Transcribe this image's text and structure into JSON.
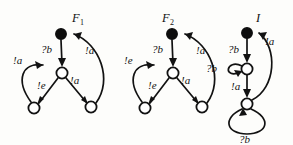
{
  "figure": {
    "name": "three-automata-figure",
    "background_color": "#fdfdfb",
    "ink_color": "#121212",
    "width": 293,
    "height": 145
  },
  "automata": [
    {
      "id": "F1",
      "title": "F",
      "title_subscript": "1",
      "states": [
        {
          "id": "f1-s0",
          "kind": "filled",
          "cx": 61,
          "cy": 34,
          "r": 5.2
        },
        {
          "id": "f1-s1",
          "kind": "open",
          "cx": 62,
          "cy": 73,
          "r": 5.6
        },
        {
          "id": "f1-s2",
          "kind": "open",
          "cx": 34,
          "cy": 108,
          "r": 5.6
        },
        {
          "id": "f1-s3",
          "kind": "open",
          "cx": 91,
          "cy": 107,
          "r": 5.6
        }
      ],
      "transitions": [
        {
          "id": "f1-t1",
          "label": "?b",
          "from": "f1-s0",
          "to": "f1-s1"
        },
        {
          "id": "f1-t2",
          "label": "!a",
          "from": "f1-s3",
          "to": "f1-s0"
        },
        {
          "id": "f1-t3",
          "label": "!e",
          "from": "f1-s1",
          "to": "f1-s2"
        },
        {
          "id": "f1-t4",
          "label": "!a",
          "from": "f1-s1",
          "to": "f1-s3"
        },
        {
          "id": "f1-t5",
          "label": "!a",
          "from": "f1-s2",
          "to": "f1-s1"
        }
      ]
    },
    {
      "id": "F2",
      "title": "F",
      "title_subscript": "2",
      "states": [
        {
          "id": "f2-s0",
          "kind": "filled",
          "cx": 172,
          "cy": 34,
          "r": 5.2
        },
        {
          "id": "f2-s1",
          "kind": "open",
          "cx": 173,
          "cy": 73,
          "r": 5.6
        },
        {
          "id": "f2-s2",
          "kind": "open",
          "cx": 145,
          "cy": 108,
          "r": 5.6
        },
        {
          "id": "f2-s3",
          "kind": "open",
          "cx": 202,
          "cy": 107,
          "r": 5.6
        }
      ],
      "transitions": [
        {
          "id": "f2-t1",
          "label": "?b",
          "from": "f2-s0",
          "to": "f2-s1"
        },
        {
          "id": "f2-t2",
          "label": "!a",
          "from": "f2-s3",
          "to": "f2-s0"
        },
        {
          "id": "f2-t3",
          "label": "!e",
          "from": "f2-s1",
          "to": "f2-s2"
        },
        {
          "id": "f2-t4",
          "label": "!a",
          "from": "f2-s1",
          "to": "f2-s3"
        },
        {
          "id": "f2-t5",
          "label": "!e",
          "from": "f2-s2",
          "to": "f2-s1"
        }
      ]
    },
    {
      "id": "I",
      "title": "I",
      "title_subscript": "",
      "states": [
        {
          "id": "i-s0",
          "kind": "filled",
          "cx": 247,
          "cy": 33,
          "r": 5.2
        },
        {
          "id": "i-s1",
          "kind": "open",
          "cx": 247,
          "cy": 69,
          "r": 5.6
        },
        {
          "id": "i-s2",
          "kind": "open",
          "cx": 247,
          "cy": 104,
          "r": 5.6
        }
      ],
      "transitions": [
        {
          "id": "i-t1",
          "label": "?b",
          "from": "i-s0",
          "to": "i-s1"
        },
        {
          "id": "i-t2",
          "label": "!a",
          "from": "i-s2",
          "to": "i-s0"
        },
        {
          "id": "i-t3",
          "label": "?b",
          "from": "i-s1",
          "to": "i-s1",
          "self_loop": true
        },
        {
          "id": "i-t4",
          "label": "!a",
          "from": "i-s1",
          "to": "i-s2"
        },
        {
          "id": "i-t5",
          "label": "?b",
          "from": "i-s2",
          "to": "i-s2",
          "self_loop": true
        }
      ]
    }
  ],
  "labels": {
    "f1_title": "F",
    "f1_sub": "1",
    "f2_title": "F",
    "f2_sub": "2",
    "i_title": "I",
    "f1_qb": "?b",
    "f1_a_right": "!a",
    "f1_a_left": "!a",
    "f1_e": "!e",
    "f1_a_mid": "!a",
    "f2_qb": "?b",
    "f2_a_right": "!a",
    "f2_e_left": "!e",
    "f2_e": "!e",
    "f2_a_mid": "!a",
    "i_qb_top": "?b",
    "i_a_right": "!a",
    "i_qb_loop": "?b",
    "i_a_mid": "!a",
    "i_qb_bottom": "?b"
  }
}
